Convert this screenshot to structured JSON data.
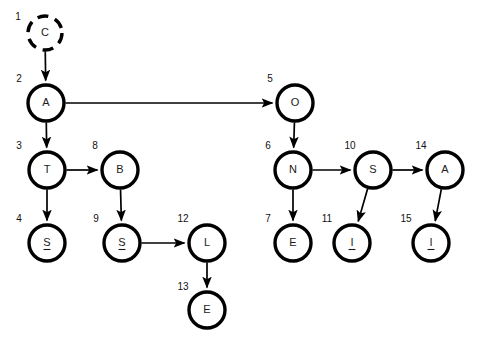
{
  "diagram": {
    "background_color": "#ffffff",
    "node_stroke_color": "#000000",
    "edge_color": "#000000",
    "label_color": "#1a1a1a",
    "nodes": [
      {
        "index": "1",
        "label": "C",
        "underlined": false,
        "style": "dashed",
        "cx": 45,
        "cy": 33,
        "r": 17,
        "index_x": 18,
        "index_y": 17
      },
      {
        "index": "2",
        "label": "A",
        "underlined": false,
        "style": "solid",
        "cx": 46,
        "cy": 103,
        "r": 18,
        "index_x": 19,
        "index_y": 79
      },
      {
        "index": "3",
        "label": "T",
        "underlined": false,
        "style": "solid",
        "cx": 47,
        "cy": 170,
        "r": 18,
        "index_x": 19,
        "index_y": 146
      },
      {
        "index": "4",
        "label": "S",
        "underlined": true,
        "style": "solid",
        "cx": 47,
        "cy": 243,
        "r": 18,
        "index_x": 19,
        "index_y": 219
      },
      {
        "index": "5",
        "label": "O",
        "underlined": false,
        "style": "solid",
        "cx": 295,
        "cy": 103,
        "r": 18,
        "index_x": 270,
        "index_y": 79
      },
      {
        "index": "6",
        "label": "N",
        "underlined": false,
        "style": "solid",
        "cx": 293,
        "cy": 170,
        "r": 18,
        "index_x": 268,
        "index_y": 146
      },
      {
        "index": "7",
        "label": "E",
        "underlined": false,
        "style": "solid",
        "cx": 293,
        "cy": 243,
        "r": 18,
        "index_x": 268,
        "index_y": 219
      },
      {
        "index": "8",
        "label": "B",
        "underlined": false,
        "style": "solid",
        "cx": 120,
        "cy": 170,
        "r": 18,
        "index_x": 95,
        "index_y": 146
      },
      {
        "index": "9",
        "label": "S",
        "underlined": true,
        "style": "solid",
        "cx": 122,
        "cy": 243,
        "r": 18,
        "index_x": 96,
        "index_y": 219
      },
      {
        "index": "10",
        "label": "S",
        "underlined": false,
        "style": "solid",
        "cx": 373,
        "cy": 170,
        "r": 18,
        "index_x": 350,
        "index_y": 146
      },
      {
        "index": "11",
        "label": "I",
        "underlined": true,
        "style": "solid",
        "cx": 352,
        "cy": 243,
        "r": 18,
        "index_x": 327,
        "index_y": 219
      },
      {
        "index": "12",
        "label": "L",
        "underlined": false,
        "style": "solid",
        "cx": 207,
        "cy": 243,
        "r": 18,
        "index_x": 183,
        "index_y": 219
      },
      {
        "index": "13",
        "label": "E",
        "underlined": false,
        "style": "solid",
        "cx": 207,
        "cy": 310,
        "r": 18,
        "index_x": 183,
        "index_y": 287
      },
      {
        "index": "14",
        "label": "A",
        "underlined": false,
        "style": "solid",
        "cx": 445,
        "cy": 170,
        "r": 18,
        "index_x": 421,
        "index_y": 146
      },
      {
        "index": "15",
        "label": "I",
        "underlined": true,
        "style": "solid",
        "cx": 431,
        "cy": 243,
        "r": 18,
        "index_x": 406,
        "index_y": 219
      }
    ],
    "edges": [
      {
        "from": "1",
        "to": "2",
        "from_label": "C",
        "to_label": "A"
      },
      {
        "from": "2",
        "to": "3",
        "from_label": "A",
        "to_label": "T"
      },
      {
        "from": "2",
        "to": "5",
        "from_label": "A",
        "to_label": "O"
      },
      {
        "from": "3",
        "to": "4",
        "from_label": "T",
        "to_label": "S"
      },
      {
        "from": "3",
        "to": "8",
        "from_label": "T",
        "to_label": "B"
      },
      {
        "from": "8",
        "to": "9",
        "from_label": "B",
        "to_label": "S"
      },
      {
        "from": "9",
        "to": "12",
        "from_label": "S",
        "to_label": "L"
      },
      {
        "from": "12",
        "to": "13",
        "from_label": "L",
        "to_label": "E"
      },
      {
        "from": "5",
        "to": "6",
        "from_label": "O",
        "to_label": "N"
      },
      {
        "from": "6",
        "to": "7",
        "from_label": "N",
        "to_label": "E"
      },
      {
        "from": "6",
        "to": "10",
        "from_label": "N",
        "to_label": "S"
      },
      {
        "from": "10",
        "to": "11",
        "from_label": "S",
        "to_label": "I"
      },
      {
        "from": "10",
        "to": "14",
        "from_label": "S",
        "to_label": "A"
      },
      {
        "from": "14",
        "to": "15",
        "from_label": "A",
        "to_label": "I"
      }
    ]
  }
}
